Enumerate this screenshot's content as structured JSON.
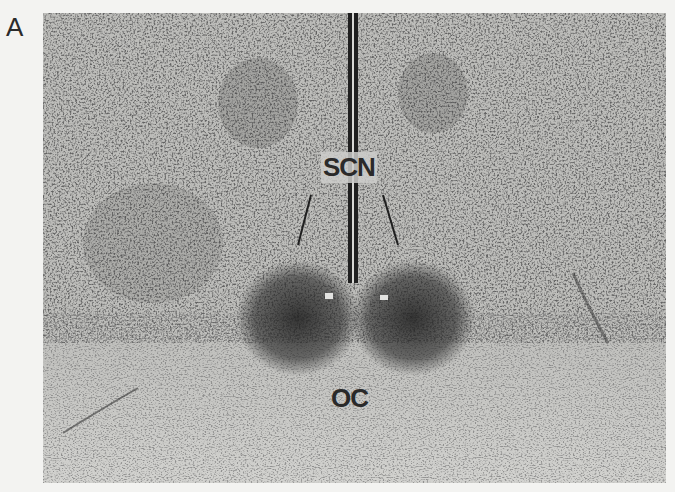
{
  "figure": {
    "panel_letter": "A",
    "labels": {
      "scn": "SCN",
      "oc": "OC"
    },
    "colors": {
      "background": "#f3f3f1",
      "tissue": "#b9b9b6",
      "stain_dark": "#2e2e2e",
      "lower_tissue": "#cfcfcc"
    }
  }
}
